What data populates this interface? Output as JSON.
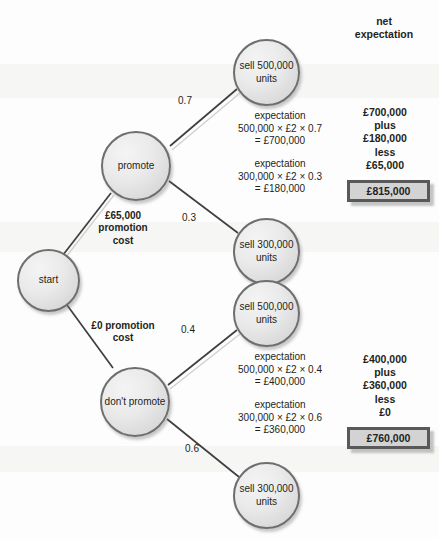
{
  "figure": {
    "type": "decision-tree",
    "column_header": "net\nexpectation"
  },
  "nodes": {
    "start": "start",
    "promote": "promote",
    "dont_promote": "don't\npromote",
    "promote_sell_high": "sell\n500,000\nunits",
    "promote_sell_low": "sell\n300,000\nunits",
    "nopromo_sell_high": "sell\n500,000\nunits",
    "nopromo_sell_low": "sell\n300,000\nunits"
  },
  "branch_costs": {
    "promote": "£65,000\npromotion\ncost",
    "dont_promote": "£0 promotion\ncost"
  },
  "probabilities": {
    "promote_high": "0.7",
    "promote_low": "0.3",
    "nopromo_high": "0.4",
    "nopromo_low": "0.6"
  },
  "expectations": {
    "promote_high": "expectation\n500,000 × £2 × 0.7\n= £700,000",
    "promote_low": "expectation\n300,000 × £2 × 0.3\n= £180,000",
    "nopromo_high": "expectation\n500,000 × £2 × 0.4\n= £400,000",
    "nopromo_low": "expectation\n300,000 × £2 × 0.6\n= £360,000"
  },
  "net_expectation": {
    "promote_breakdown": "£700,000\nplus\n£180,000\nless\n£65,000",
    "promote_total": "£815,000",
    "dont_promote_breakdown": "£400,000\nplus\n£360,000\nless\n£0",
    "dont_promote_total": "£760,000"
  },
  "colors": {
    "node_border": "#6e6e6e",
    "edge": "#3f3f3f",
    "box_border": "#595959",
    "box_fill": "#d3d3d3",
    "text": "#231f20"
  }
}
